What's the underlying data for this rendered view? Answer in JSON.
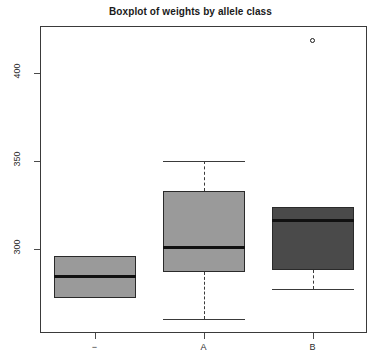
{
  "chart_data": {
    "type": "box",
    "title": "Boxplot of weights by allele class",
    "xlabel": "",
    "ylabel": "",
    "categories": [
      "−",
      "A",
      "B"
    ],
    "ylim": [
      252,
      427
    ],
    "yticks": [
      300,
      350,
      400
    ],
    "ytick_labels": [
      "300",
      "350",
      "400"
    ],
    "grid": false,
    "legend": "none",
    "boxes": [
      {
        "category": "−",
        "min": 272,
        "q1": 272,
        "median": 284,
        "q3": 296,
        "max": 296,
        "fill": "#9a9a9a",
        "outliers": []
      },
      {
        "category": "A",
        "min": 260,
        "q1": 287,
        "median": 301,
        "q3": 333,
        "max": 350,
        "fill": "#9a9a9a",
        "outliers": []
      },
      {
        "category": "B",
        "min": 277,
        "q1": 288,
        "median": 316,
        "q3": 324,
        "max": 324,
        "fill": "#4a4a4a",
        "outliers": [
          419
        ]
      }
    ]
  },
  "colors": {
    "frame": "#3a3a3a",
    "median": "#111111",
    "box_light": "#9a9a9a",
    "box_dark": "#4a4a4a",
    "background": "#ffffff",
    "text": "#2b2b2b"
  }
}
